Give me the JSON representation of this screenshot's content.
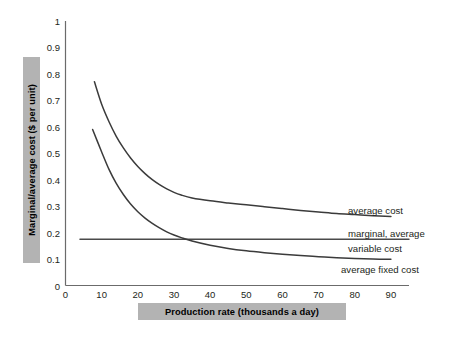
{
  "chart_data": {
    "type": "line",
    "title": "",
    "xlabel": "Production rate (thousands a day)",
    "ylabel": "Marginal/average cost ($ per unit)",
    "xlim": [
      0,
      95
    ],
    "ylim": [
      0,
      1
    ],
    "grid": false,
    "legend_position": "inline-right-annotations",
    "x_ticks": [
      "0",
      "10",
      "20",
      "30",
      "40",
      "50",
      "60",
      "70",
      "80",
      "90"
    ],
    "x_tick_values": [
      0,
      10,
      20,
      30,
      40,
      50,
      60,
      70,
      80,
      90
    ],
    "y_ticks": [
      "0",
      "0.1",
      "0.2",
      "0.3",
      "0.4",
      "0.5",
      "0.6",
      "0.7",
      "0.8",
      "0.9",
      "1"
    ],
    "y_tick_values": [
      0,
      0.1,
      0.2,
      0.3,
      0.4,
      0.5,
      0.6,
      0.7,
      0.8,
      0.9,
      1
    ],
    "series": [
      {
        "name": "average cost",
        "label": "average cost",
        "color": "#3b3b3b",
        "x": [
          8,
          10,
          12,
          14,
          16,
          18,
          20,
          22,
          24,
          26,
          28,
          30,
          32,
          35,
          40,
          45,
          50,
          55,
          60,
          65,
          70,
          75,
          80,
          85,
          90
        ],
        "y": [
          0.77,
          0.685,
          0.62,
          0.565,
          0.52,
          0.482,
          0.45,
          0.423,
          0.4,
          0.381,
          0.365,
          0.352,
          0.342,
          0.331,
          0.32,
          0.312,
          0.305,
          0.298,
          0.291,
          0.284,
          0.278,
          0.272,
          0.268,
          0.264,
          0.261
        ]
      },
      {
        "name": "marginal, average variable cost",
        "label": "marginal, average variable cost",
        "color": "#4a4a4a",
        "x": [
          4,
          95
        ],
        "y": [
          0.175,
          0.175
        ]
      },
      {
        "name": "average fixed cost",
        "label": "average fixed cost",
        "color": "#3b3b3b",
        "x": [
          7.5,
          10,
          12,
          14,
          16,
          18,
          20,
          22,
          24,
          26,
          28,
          30,
          32,
          35,
          40,
          45,
          50,
          55,
          60,
          65,
          70,
          75,
          80,
          85,
          90
        ],
        "y": [
          0.59,
          0.505,
          0.44,
          0.387,
          0.344,
          0.308,
          0.279,
          0.255,
          0.235,
          0.218,
          0.203,
          0.191,
          0.181,
          0.168,
          0.152,
          0.14,
          0.131,
          0.124,
          0.118,
          0.113,
          0.109,
          0.105,
          0.102,
          0.1,
          0.099
        ]
      }
    ],
    "annotations": [
      {
        "text": "average cost",
        "x": 90,
        "y": 0.29
      },
      {
        "text": "marginal, average",
        "x": 90,
        "y": 0.205
      },
      {
        "text": "variable cost",
        "x": 90,
        "y": 0.158
      },
      {
        "text": "average fixed cost",
        "x": 90,
        "y": 0.072
      }
    ],
    "colors": {
      "axis": "#6b6b6b",
      "curve": "#3b3b3b",
      "label_box_bg": "#b3b3b3",
      "text": "#231f20",
      "background": "#ffffff"
    }
  },
  "axes": {
    "y_title": "Marginal/average cost ($ per unit)",
    "x_title": "Production rate (thousands a day)",
    "y_tick_labels": [
      "1",
      "0.9",
      "0.8",
      "0.7",
      "0.6",
      "0.5",
      "0.4",
      "0.3",
      "0.2",
      "0.1",
      "0"
    ],
    "x_tick_labels": [
      "0",
      "10",
      "20",
      "30",
      "40",
      "50",
      "60",
      "70",
      "80",
      "90"
    ]
  },
  "annotations": {
    "average_cost": "average cost",
    "marginal_average": "marginal, average",
    "variable_cost": "variable cost",
    "average_fixed_cost": "average fixed cost"
  }
}
